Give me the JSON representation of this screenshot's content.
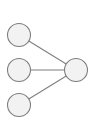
{
  "figure": {
    "type": "node-link-diagram",
    "width": 95,
    "height": 136,
    "background_color": "#ffffff",
    "title": "",
    "caption": ""
  },
  "style": {
    "node_fill": "#f2f2f2",
    "node_stroke": "#7f7f7f",
    "node_stroke_width": 1.1,
    "node_radius": 11.5,
    "edge_color": "#7f7f7f",
    "edge_width": 1.1
  },
  "chart_data": {
    "type": "diagram",
    "subtype": "node-link-graph",
    "title": "",
    "xlabel": "",
    "ylabel": "",
    "grid": false,
    "legend": false,
    "directed": false,
    "node_count": 4,
    "edge_count": 3,
    "nodes": [
      {
        "id": "n1",
        "label": "",
        "x": 19,
        "y": 35,
        "r": 11.5,
        "group": "left"
      },
      {
        "id": "n2",
        "label": "",
        "x": 19,
        "y": 70,
        "r": 11.5,
        "group": "left"
      },
      {
        "id": "n3",
        "label": "",
        "x": 19,
        "y": 105,
        "r": 11.5,
        "group": "left"
      },
      {
        "id": "n4",
        "label": "",
        "x": 76,
        "y": 70,
        "r": 11.5,
        "group": "right"
      }
    ],
    "edges": [
      {
        "id": "e1",
        "source": "n1",
        "target": "n4",
        "label": ""
      },
      {
        "id": "e2",
        "source": "n2",
        "target": "n4",
        "label": ""
      },
      {
        "id": "e3",
        "source": "n3",
        "target": "n4",
        "label": ""
      }
    ]
  }
}
